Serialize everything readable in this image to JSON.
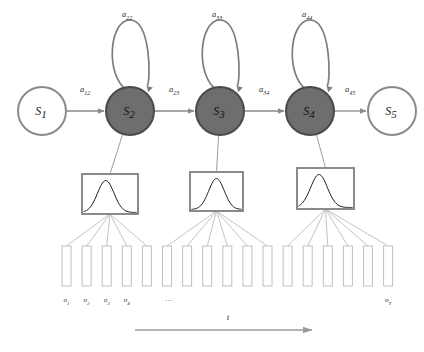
{
  "figure": {
    "type": "diagram"
  },
  "colors": {
    "state_active_fill": "#6e6e6e",
    "state_active_stroke": "#4a4a4a",
    "state_inactive_fill": "#ffffff",
    "state_inactive_stroke": "#8a8a8a",
    "arrow": "#8a8a8a",
    "self_loop": "#7d7d7d",
    "emission_box_stroke": "#8a8a8a",
    "gaussian_curve": "#1a1a1a",
    "observation_stroke": "#c0c0c0",
    "fan_line": "#b5b5b5",
    "time_axis": "#9a9a9a",
    "text": "#2b2b2b"
  },
  "states": [
    {
      "id": "s1",
      "label": "S",
      "sub": "1",
      "cx": 42,
      "cy": 111,
      "r": 24,
      "active": false
    },
    {
      "id": "s2",
      "label": "S",
      "sub": "2",
      "cx": 130,
      "cy": 111,
      "r": 24,
      "active": true
    },
    {
      "id": "s3",
      "label": "S",
      "sub": "3",
      "cx": 220,
      "cy": 111,
      "r": 24,
      "active": true
    },
    {
      "id": "s4",
      "label": "S",
      "sub": "4",
      "cx": 310,
      "cy": 111,
      "r": 24,
      "active": true
    },
    {
      "id": "s5",
      "label": "S",
      "sub": "5",
      "cx": 392,
      "cy": 111,
      "r": 24,
      "active": false
    }
  ],
  "transitions": [
    {
      "id": "a12",
      "label": "a",
      "sub": "12",
      "from": "s1",
      "to": "s2",
      "x1": 67,
      "x2": 104,
      "y": 111,
      "lx": 80,
      "ly": 92
    },
    {
      "id": "a23",
      "label": "a",
      "sub": "23",
      "from": "s2",
      "to": "s3",
      "x1": 155,
      "x2": 194,
      "y": 111,
      "lx": 169,
      "ly": 92
    },
    {
      "id": "a34",
      "label": "a",
      "sub": "34",
      "from": "s3",
      "to": "s4",
      "x1": 245,
      "x2": 284,
      "y": 111,
      "lx": 259,
      "ly": 92
    },
    {
      "id": "a45",
      "label": "a",
      "sub": "45",
      "from": "s4",
      "to": "s5",
      "x1": 335,
      "x2": 366,
      "y": 111,
      "lx": 345,
      "ly": 92
    }
  ],
  "self_loops": [
    {
      "id": "a22",
      "label": "a",
      "sub": "22",
      "cx": 130,
      "top": 20,
      "lx": 122,
      "ly": 17
    },
    {
      "id": "a33",
      "label": "a",
      "sub": "33",
      "cx": 220,
      "top": 20,
      "lx": 212,
      "ly": 17
    },
    {
      "id": "a44",
      "label": "a",
      "sub": "44",
      "cx": 310,
      "top": 20,
      "lx": 302,
      "ly": 17
    }
  ],
  "emissions": [
    {
      "id": "b2",
      "state": "s2",
      "x": 82,
      "y": 174,
      "w": 56,
      "h": 40,
      "peak": 0.42
    },
    {
      "id": "b3",
      "state": "s3",
      "x": 190,
      "y": 172,
      "w": 53,
      "h": 39,
      "peak": 0.5
    },
    {
      "id": "b4",
      "state": "s4",
      "x": 297,
      "y": 168,
      "w": 57,
      "h": 41,
      "peak": 0.38
    }
  ],
  "observations": {
    "count": 17,
    "start_x": 62,
    "pitch": 20.1,
    "width": 9,
    "top": 246,
    "height": 40,
    "label_y": 302,
    "labeled": [
      {
        "index": 0,
        "label": "o",
        "sub": "1"
      },
      {
        "index": 1,
        "label": "o",
        "sub": "2"
      },
      {
        "index": 2,
        "label": "o",
        "sub": "3"
      },
      {
        "index": 3,
        "label": "o",
        "sub": "4"
      },
      {
        "index": 16,
        "label": "o",
        "sub": "T"
      }
    ],
    "ellipsis": {
      "text": "...",
      "index": 5
    }
  },
  "fan_links": [
    {
      "emission": "b2",
      "targets": [
        0,
        1,
        2,
        3,
        4
      ]
    },
    {
      "emission": "b3",
      "targets": [
        5,
        6,
        7,
        8,
        9,
        10
      ]
    },
    {
      "emission": "b4",
      "targets": [
        11,
        12,
        13,
        14,
        15,
        16
      ]
    }
  ],
  "time_axis": {
    "label": "t",
    "x1": 135,
    "x2": 312,
    "y": 330,
    "label_x": 228,
    "label_y": 320
  }
}
